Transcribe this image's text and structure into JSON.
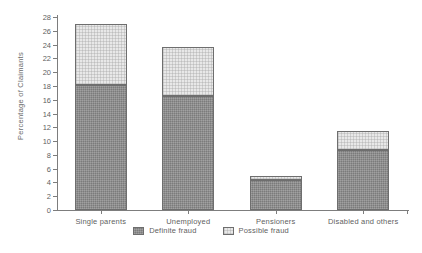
{
  "chart_data": {
    "type": "bar",
    "subtype": "stacked-vertical",
    "title": "",
    "xlabel": "",
    "ylabel": "Percentage of Claimants",
    "categories": [
      "Single parents",
      "Unemployed",
      "Pensioners",
      "Disabled and others"
    ],
    "series": [
      {
        "name": "Definite fraud",
        "color": "#8a8a8a",
        "values": [
          18.1,
          16.5,
          4.4,
          8.7
        ]
      },
      {
        "name": "Possible fraud",
        "color": "#e8e8e8",
        "values": [
          8.9,
          7.2,
          0.6,
          2.7
        ]
      }
    ],
    "totals": [
      27.0,
      23.7,
      5.0,
      11.4
    ],
    "ylim": [
      0,
      28
    ],
    "yticks": [
      0,
      2,
      4,
      6,
      8,
      10,
      12,
      14,
      16,
      18,
      20,
      22,
      24,
      26,
      28
    ],
    "ytick_labels": [
      "0",
      "2",
      "4",
      "6",
      "8",
      "10",
      "12",
      "14",
      "16",
      "18",
      "20",
      "22",
      "24",
      "26",
      "28"
    ],
    "grid": false,
    "legend_position": "bottom-center"
  },
  "legend": {
    "items": [
      {
        "label": "Definite fraud",
        "color": "#8a8a8a"
      },
      {
        "label": "Possible fraud",
        "color": "#e8e8e8"
      }
    ]
  }
}
